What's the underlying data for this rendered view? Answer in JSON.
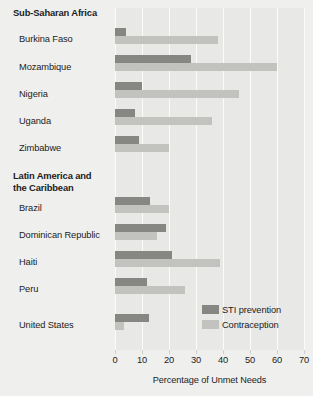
{
  "chart_data": {
    "type": "bar",
    "orientation": "horizontal",
    "title": "",
    "xlabel": "Percentage of Unmet Needs",
    "ylabel": "",
    "xlim": [
      0,
      70
    ],
    "xticks": [
      0,
      10,
      20,
      30,
      40,
      50,
      60,
      70
    ],
    "grid": true,
    "legend_position": "inside-bottom-right",
    "series": [
      {
        "name": "STI prevention",
        "color": "#868683",
        "values": [
          4,
          28,
          10,
          7.5,
          9,
          13,
          19,
          21,
          12,
          12.5
        ]
      },
      {
        "name": "Contraception",
        "color": "#c2c2be",
        "values": [
          38,
          60,
          46,
          36,
          20,
          20,
          15.5,
          39,
          26,
          3.5
        ]
      }
    ],
    "categories": [
      "Burkina Faso",
      "Mozambique",
      "Nigeria",
      "Uganda",
      "Zimbabwe",
      "Brazil",
      "Dominican Republic",
      "Haiti",
      "Peru",
      "United States"
    ],
    "groups": [
      {
        "header": "Sub-Saharan Africa",
        "categories": [
          "Burkina Faso",
          "Mozambique",
          "Nigeria",
          "Uganda",
          "Zimbabwe"
        ]
      },
      {
        "header": "Latin America and\nthe Caribbean",
        "categories": [
          "Brazil",
          "Dominican Republic",
          "Haiti",
          "Peru"
        ]
      },
      {
        "header": "",
        "categories": [
          "United States"
        ]
      }
    ]
  },
  "axis": {
    "title": "Percentage of Unmet Needs",
    "tick_labels": [
      "0",
      "10",
      "20",
      "30",
      "40",
      "50",
      "60",
      "70"
    ]
  },
  "legend": {
    "items": [
      {
        "label": "STI prevention",
        "color": "#868683"
      },
      {
        "label": "Contraception",
        "color": "#c2c2be"
      }
    ]
  },
  "labels": {
    "group_africa": "Sub-Saharan Africa",
    "group_latin": "Latin America and\nthe Caribbean",
    "burkina_faso": "Burkina Faso",
    "mozambique": "Mozambique",
    "nigeria": "Nigeria",
    "uganda": "Uganda",
    "zimbabwe": "Zimbabwe",
    "brazil": "Brazil",
    "dominican_republic": "Dominican Republic",
    "haiti": "Haiti",
    "peru": "Peru",
    "united_states": "United States"
  },
  "colors": {
    "background": "#efefed",
    "plot_background": "#e8e8e6",
    "gridline": "#fbfbfa",
    "sti": "#868683",
    "contraception": "#c2c2be"
  }
}
